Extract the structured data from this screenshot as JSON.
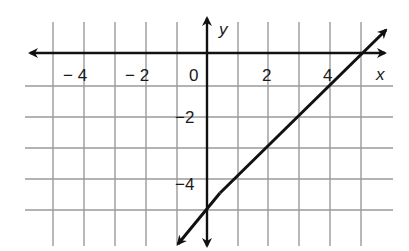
{
  "graph": {
    "x_axis_label": "x",
    "y_axis_label": "y",
    "x_tick_labels": [
      {
        "value": -4,
        "text": "− 4"
      },
      {
        "value": -2,
        "text": "− 2"
      },
      {
        "value": 0,
        "text": "0"
      },
      {
        "value": 2,
        "text": "2"
      },
      {
        "value": 4,
        "text": "4"
      }
    ],
    "y_tick_labels": [
      {
        "value": -2,
        "text": "−2"
      },
      {
        "value": -4,
        "text": "−4"
      }
    ],
    "grid": {
      "x_min": -5,
      "x_max": 6,
      "y_min": -6,
      "y_max": 1
    },
    "line": {
      "equation": "y = x - 5",
      "x_intercept": 5,
      "y_intercept": -5
    },
    "colors": {
      "grid": "#9a9a9a",
      "axis": "#111111",
      "line": "#111111"
    }
  }
}
